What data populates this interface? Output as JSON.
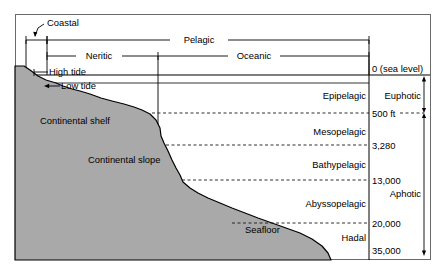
{
  "diagram": {
    "frame": {
      "x": 15,
      "y": 14,
      "width": 416,
      "height": 246
    },
    "colors": {
      "land_fill": "#a8a8a8",
      "line": "#000000",
      "frame": "#555555",
      "dashed": "#333333",
      "background": "#ffffff"
    },
    "brackets": [
      {
        "name": "coastal",
        "label": "Coastal",
        "left": 26,
        "right": 47,
        "y": 40
      },
      {
        "name": "pelagic",
        "label": "Pelagic",
        "left": 47,
        "right": 369,
        "y": 40
      },
      {
        "name": "neritic",
        "label": "Neritic",
        "left": 47,
        "right": 158,
        "y": 56
      },
      {
        "name": "oceanic",
        "label": "Oceanic",
        "left": 158,
        "right": 369,
        "y": 56
      }
    ],
    "tide_labels": [
      {
        "name": "high-tide",
        "label": "High tide",
        "x": 51,
        "y": 71
      },
      {
        "name": "low-tide",
        "label": "Low tide",
        "x": 62,
        "y": 85
      }
    ],
    "landform_labels": [
      {
        "name": "continental-shelf",
        "label": "Continental shelf",
        "x": 40,
        "y": 121
      },
      {
        "name": "continental-slope",
        "label": "Continental slope",
        "x": 88,
        "y": 160
      },
      {
        "name": "seafloor",
        "label": "Seafloor",
        "x": 245,
        "y": 230
      }
    ],
    "sea_level": {
      "label": "0 (sea level)",
      "y": 75,
      "label_x": 372
    },
    "pelagic_zones": [
      {
        "name": "epipelagic",
        "label": "Epipelagic",
        "top": 75,
        "bottom": 113
      },
      {
        "name": "mesopelagic",
        "label": "Mesopelagic",
        "top": 113,
        "bottom": 145
      },
      {
        "name": "bathypelagic",
        "label": "Bathypelagic",
        "top": 145,
        "bottom": 180
      },
      {
        "name": "abyssopelagic",
        "label": "Abyssopelagic",
        "top": 180,
        "bottom": 223
      },
      {
        "name": "hadal",
        "label": "Hadal",
        "top": 223,
        "bottom": 250
      }
    ],
    "depth_markers": [
      {
        "name": "depth-500ft",
        "label": "500 ft",
        "y": 113,
        "dashed_from": 170
      },
      {
        "name": "depth-3280",
        "label": "3,280",
        "y": 145,
        "dashed_from": 183
      },
      {
        "name": "depth-13000",
        "label": "13,000",
        "y": 180,
        "dashed_from": 196
      },
      {
        "name": "depth-20000",
        "label": "20,000",
        "y": 223,
        "dashed_from": 235
      },
      {
        "name": "depth-35000",
        "label": "35,000",
        "y": 250,
        "dashed_from": 360
      }
    ],
    "light_zones": [
      {
        "name": "euphotic",
        "label": "Euphotic",
        "top": 75,
        "bottom": 113,
        "label_y": 99
      },
      {
        "name": "aphotic",
        "label": "Aphotic",
        "top": 113,
        "bottom": 256,
        "label_y": 197
      }
    ],
    "column_dividers": [
      {
        "name": "zone-name-divider",
        "x": 369
      },
      {
        "name": "light-zone-divider",
        "x": 424
      }
    ],
    "land_profile": "M 15,66 L 24,66 L 30,70 L 38,76 L 46,80 L 56,83 L 63,86 L 72,89 L 80,91 L 90,94 L 101,98 L 112,101 L 124,104 L 134,107 L 142,110 L 150,114 L 156,120 L 160,128 L 161,136 L 164,143 L 168,151 L 172,160 L 176,168 L 180,175 L 183,182 L 190,188 L 198,193 L 208,198 L 220,203 L 232,208 L 245,213 L 258,218 L 272,223 L 286,228 L 300,233 L 312,239 L 322,246 L 328,253 L 331,260 L 15,260 Z"
  }
}
